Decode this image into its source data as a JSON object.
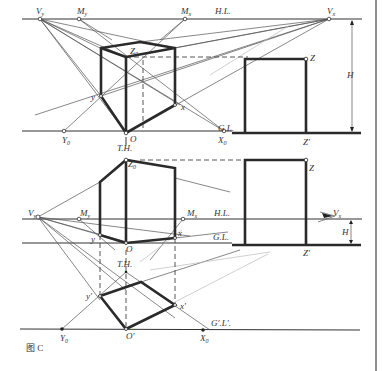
{
  "figure": {
    "caption": "图 C",
    "type": "two-point perspective construction of a box (measuring-point method)"
  },
  "top_view": {
    "labels": {
      "vy": "V",
      "vy_sub": "y",
      "my": "M",
      "my_sub": "y",
      "mx": "M",
      "mx_sub": "x",
      "hl": "H.L.",
      "vx": "V",
      "vx_sub": "x",
      "z0": "Z",
      "z0_sub": "0",
      "z": "Z",
      "zp": "Z′",
      "h": "H",
      "y": "y",
      "x": "x",
      "y0": "Y",
      "y0_sub": "0",
      "o": "O",
      "x0": "X",
      "x0_sub": "0",
      "gl": "G.L."
    }
  },
  "bottom_view": {
    "labels": {
      "th_top": "T.H.",
      "z0": "Z",
      "z0_sub": "0",
      "z": "Z",
      "vy": "V",
      "vy_sub": "y",
      "my": "M",
      "my_sub": "y",
      "mx": "M",
      "mx_sub": "x",
      "hl": "H.L.",
      "vx": "V",
      "vx_sub": "x",
      "h": "H",
      "gl": "G.L.",
      "zp": "Z′",
      "y": "y",
      "o": "O",
      "x": "x",
      "th_mid": "T.H.",
      "yp": "y′",
      "xp": "x′",
      "y0": "Y",
      "y0_sub": "0",
      "op": "O′",
      "x0": "X",
      "x0_sub": "0",
      "gpl": "G′.L′."
    }
  }
}
